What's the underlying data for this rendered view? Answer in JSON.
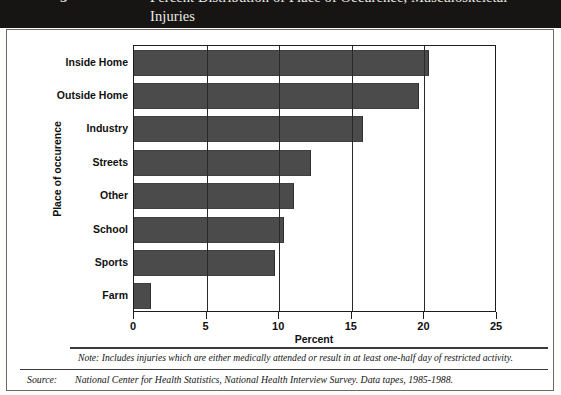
{
  "header": {
    "figure_number": "5",
    "title_line1": "Percent Distribution of Place of Occurence, Musculoskeletal Injuries",
    "title_line2": "United States, 1985-1988",
    "band_color": "#161513"
  },
  "chart_data": {
    "type": "bar",
    "orientation": "horizontal",
    "title": "Percent Distribution of Place of Occurence, Musculoskeletal Injuries United States, 1985-1988",
    "categories": [
      "Inside Home",
      "Outside Home",
      "Industry",
      "Streets",
      "Other",
      "School",
      "Sports",
      "Farm"
    ],
    "values": [
      20.3,
      19.6,
      15.8,
      12.2,
      11.0,
      10.3,
      9.7,
      1.2
    ],
    "xlabel": "Percent",
    "ylabel": "Place of occurence",
    "xlim": [
      0,
      25
    ],
    "xticks": [
      "0",
      "5",
      "10",
      "15",
      "20",
      "25"
    ],
    "grid": true,
    "legend": false,
    "bar_color": "#4b4b4b",
    "axis_color": "#1d1d1d"
  },
  "footer": {
    "note_text": "Note: Includes injuries which are either medically attended or result in at least one-half day of restricted activity.",
    "source_label": "Source:",
    "source_text": "National Center for Health Statistics, National Health Interview Survey.  Data tapes, 1985-1988."
  }
}
